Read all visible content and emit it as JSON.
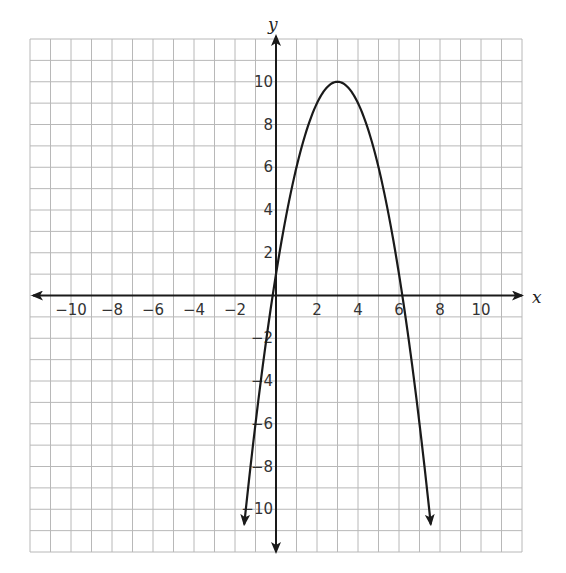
{
  "chart_data": {
    "type": "line",
    "title": "",
    "xlabel": "x",
    "ylabel": "y",
    "xlim": [
      -12,
      12
    ],
    "ylim": [
      -12,
      12
    ],
    "grid": true,
    "x_ticks": [
      -10,
      -8,
      -6,
      -4,
      -2,
      2,
      4,
      6,
      8,
      10
    ],
    "y_ticks": [
      10,
      8,
      6,
      4,
      2,
      -2,
      -4,
      -6,
      -8,
      -10
    ],
    "x_tick_labels": [
      "−10",
      "−8",
      "−6",
      "−4",
      "−2",
      "2",
      "4",
      "6",
      "8",
      "10"
    ],
    "y_tick_labels": [
      "10",
      "8",
      "6",
      "4",
      "2",
      "−2",
      "−4",
      "−6",
      "−8",
      "−10"
    ],
    "series": [
      {
        "name": "parabola",
        "equation": "y = -(x - 3)^2 + 10",
        "vertex": [
          3,
          10
        ],
        "x_intercepts": [
          -0.16,
          6.16
        ],
        "y_intercept": 1,
        "x": [
          -1.55,
          -1,
          0,
          1,
          2,
          3,
          4,
          5,
          6,
          7,
          7.55
        ],
        "y": [
          -10.7,
          -6,
          1,
          6,
          9,
          10,
          9,
          6,
          1,
          -6,
          -10.7
        ],
        "arrows_at_ends": true
      }
    ],
    "legend": null
  },
  "colors": {
    "grid": "#b8b8b8",
    "axis": "#1a1a1a",
    "curve": "#1a1a1a"
  }
}
